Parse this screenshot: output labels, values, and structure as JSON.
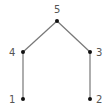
{
  "diagram": {
    "type": "graph",
    "nodes": [
      {
        "id": "1",
        "label": "1",
        "x": 23,
        "y": 99
      },
      {
        "id": "2",
        "label": "2",
        "x": 90,
        "y": 99
      },
      {
        "id": "3",
        "label": "3",
        "x": 90,
        "y": 52
      },
      {
        "id": "4",
        "label": "4",
        "x": 23,
        "y": 52
      },
      {
        "id": "5",
        "label": "5",
        "x": 57,
        "y": 21
      }
    ],
    "edges": [
      {
        "from": "1",
        "to": "4"
      },
      {
        "from": "4",
        "to": "5"
      },
      {
        "from": "5",
        "to": "3"
      },
      {
        "from": "3",
        "to": "2"
      }
    ],
    "colors": {
      "edge": "#777777",
      "node": "#111111",
      "label": "#555555"
    }
  }
}
